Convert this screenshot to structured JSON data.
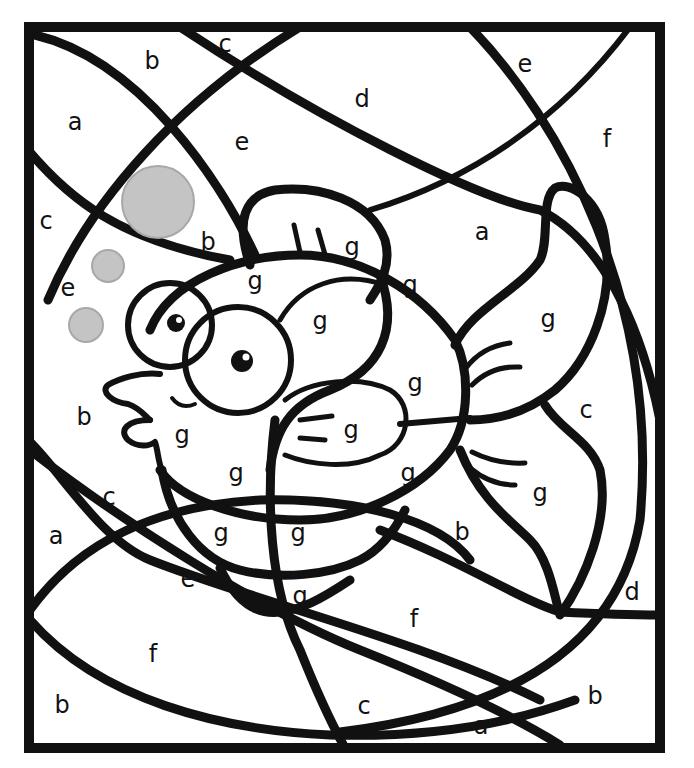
{
  "page": {
    "type": "color-by-letter worksheet",
    "colors": {
      "background": "#ffffff",
      "line": "#111111",
      "bubble_fill": "#c4c4c4",
      "bubble_stroke": "#a8a8a8"
    }
  },
  "bubbles": [
    {
      "name": "bubble-large",
      "cx": 158,
      "cy": 202,
      "r": 36
    },
    {
      "name": "bubble-medium",
      "cx": 108,
      "cy": 266,
      "r": 16
    },
    {
      "name": "bubble-small",
      "cx": 86,
      "cy": 325,
      "r": 17
    }
  ],
  "labels": [
    {
      "letter": "b",
      "x": 152,
      "y": 62
    },
    {
      "letter": "c",
      "x": 225,
      "y": 45
    },
    {
      "letter": "e",
      "x": 525,
      "y": 65
    },
    {
      "letter": "a",
      "x": 75,
      "y": 123
    },
    {
      "letter": "d",
      "x": 362,
      "y": 100
    },
    {
      "letter": "e",
      "x": 242,
      "y": 143
    },
    {
      "letter": "f",
      "x": 607,
      "y": 140
    },
    {
      "letter": "c",
      "x": 46,
      "y": 222
    },
    {
      "letter": "b",
      "x": 208,
      "y": 243
    },
    {
      "letter": "g",
      "x": 352,
      "y": 248
    },
    {
      "letter": "a",
      "x": 482,
      "y": 233
    },
    {
      "letter": "e",
      "x": 68,
      "y": 289
    },
    {
      "letter": "g",
      "x": 255,
      "y": 282
    },
    {
      "letter": "g",
      "x": 410,
      "y": 286
    },
    {
      "letter": "g",
      "x": 320,
      "y": 322
    },
    {
      "letter": "g",
      "x": 548,
      "y": 320
    },
    {
      "letter": "g",
      "x": 415,
      "y": 384
    },
    {
      "letter": "b",
      "x": 84,
      "y": 418
    },
    {
      "letter": "c",
      "x": 586,
      "y": 411
    },
    {
      "letter": "g",
      "x": 182,
      "y": 436
    },
    {
      "letter": "g",
      "x": 351,
      "y": 431
    },
    {
      "letter": "g",
      "x": 236,
      "y": 474
    },
    {
      "letter": "g",
      "x": 408,
      "y": 474
    },
    {
      "letter": "c",
      "x": 109,
      "y": 498
    },
    {
      "letter": "g",
      "x": 540,
      "y": 494
    },
    {
      "letter": "a",
      "x": 56,
      "y": 537
    },
    {
      "letter": "g",
      "x": 221,
      "y": 534
    },
    {
      "letter": "g",
      "x": 298,
      "y": 534
    },
    {
      "letter": "b",
      "x": 462,
      "y": 533
    },
    {
      "letter": "e",
      "x": 188,
      "y": 580
    },
    {
      "letter": "g",
      "x": 257,
      "y": 601
    },
    {
      "letter": "g",
      "x": 300,
      "y": 597
    },
    {
      "letter": "d",
      "x": 632,
      "y": 593
    },
    {
      "letter": "f",
      "x": 414,
      "y": 620
    },
    {
      "letter": "f",
      "x": 153,
      "y": 655
    },
    {
      "letter": "b",
      "x": 62,
      "y": 706
    },
    {
      "letter": "b",
      "x": 595,
      "y": 697
    },
    {
      "letter": "c",
      "x": 364,
      "y": 707
    },
    {
      "letter": "a",
      "x": 481,
      "y": 727
    }
  ]
}
